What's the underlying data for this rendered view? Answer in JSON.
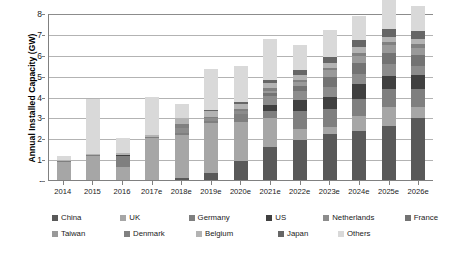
{
  "chart_data": {
    "type": "bar",
    "stacked": true,
    "title": "",
    "xlabel": "",
    "ylabel": "Annual Installed Capacity (GW)",
    "ylim": [
      0,
      8
    ],
    "yticks": [
      "-",
      "1",
      "2",
      "3",
      "4",
      "5",
      "6",
      "7",
      "8"
    ],
    "grid": true,
    "legend_position": "bottom",
    "categories": [
      "2014",
      "2015",
      "2016",
      "2017e",
      "2018e",
      "2019e",
      "2020e",
      "2021e",
      "2022e",
      "2023e",
      "2024e",
      "2025e",
      "2026e"
    ],
    "series": [
      {
        "name": "China",
        "color": "#595959",
        "values": [
          0.0,
          0.0,
          0.0,
          0.0,
          0.1,
          0.35,
          0.9,
          1.6,
          1.9,
          2.2,
          2.35,
          2.6,
          2.95
        ]
      },
      {
        "name": "UK",
        "color": "#a6a6a6",
        "values": [
          0.85,
          1.15,
          0.6,
          2.0,
          2.05,
          2.4,
          1.9,
          1.35,
          0.55,
          0.35,
          0.7,
          0.9,
          0.55
        ]
      },
      {
        "name": "Germany",
        "color": "#7f7f7f",
        "values": [
          0.05,
          0.05,
          0.55,
          0.05,
          0.1,
          0.1,
          0.35,
          0.35,
          0.85,
          0.85,
          0.85,
          0.85,
          0.85
        ]
      },
      {
        "name": "US",
        "color": "#404040",
        "values": [
          0.0,
          0.0,
          0.03,
          0.0,
          0.0,
          0.0,
          0.0,
          0.3,
          0.55,
          0.6,
          0.7,
          0.65,
          0.7
        ]
      },
      {
        "name": "Netherlands",
        "color": "#8c8c8c",
        "values": [
          0.0,
          0.0,
          0.0,
          0.0,
          0.25,
          0.1,
          0.15,
          0.45,
          0.4,
          0.45,
          0.5,
          0.55,
          0.4
        ]
      },
      {
        "name": "France",
        "color": "#737373",
        "values": [
          0.0,
          0.0,
          0.0,
          0.0,
          0.0,
          0.0,
          0.0,
          0.1,
          0.25,
          0.5,
          0.5,
          0.55,
          0.55
        ]
      },
      {
        "name": "Taiwan",
        "color": "#999999",
        "values": [
          0.0,
          0.0,
          0.0,
          0.0,
          0.0,
          0.0,
          0.0,
          0.1,
          0.2,
          0.3,
          0.35,
          0.35,
          0.35
        ]
      },
      {
        "name": "Denmark",
        "color": "#808080",
        "values": [
          0.0,
          0.0,
          0.0,
          0.0,
          0.2,
          0.05,
          0.1,
          0.15,
          0.1,
          0.1,
          0.15,
          0.15,
          0.15
        ]
      },
      {
        "name": "Belgium",
        "color": "#b3b3b3",
        "values": [
          0.05,
          0.05,
          0.1,
          0.1,
          0.25,
          0.3,
          0.25,
          0.25,
          0.25,
          0.25,
          0.25,
          0.25,
          0.25
        ]
      },
      {
        "name": "Japan",
        "color": "#666666",
        "values": [
          0.0,
          0.0,
          0.0,
          0.0,
          0.0,
          0.05,
          0.1,
          0.15,
          0.2,
          0.3,
          0.35,
          0.4,
          0.4
        ]
      },
      {
        "name": "Others",
        "color": "#d9d9d9",
        "values": [
          0.2,
          2.65,
          0.72,
          1.85,
          0.7,
          1.95,
          1.7,
          1.95,
          1.2,
          1.3,
          1.15,
          1.45,
          1.2
        ]
      }
    ],
    "totals": [
      1.15,
      3.9,
      2.0,
      4.0,
      3.65,
      5.3,
      5.45,
      6.75,
      6.45,
      7.2,
      7.85,
      8.7,
      8.35
    ]
  },
  "axis": {
    "y_title": "Annual Installed Capacity (GW)"
  },
  "legend": {
    "rows": [
      [
        {
          "label": "China",
          "color": "#595959"
        },
        {
          "label": "UK",
          "color": "#a6a6a6"
        },
        {
          "label": "Germany",
          "color": "#7f7f7f"
        },
        {
          "label": "US",
          "color": "#404040"
        },
        {
          "label": "Netherlands",
          "color": "#8c8c8c"
        },
        {
          "label": "France",
          "color": "#737373"
        }
      ],
      [
        {
          "label": "Taiwan",
          "color": "#999999"
        },
        {
          "label": "Denmark",
          "color": "#808080"
        },
        {
          "label": "Belgium",
          "color": "#b3b3b3"
        },
        {
          "label": "Japan",
          "color": "#666666"
        },
        {
          "label": "Others",
          "color": "#d9d9d9"
        }
      ]
    ]
  },
  "colors": {
    "plot_border": "#808080",
    "gridline": "#b3b3b3",
    "background": "#ffffff",
    "text": "#1a1a1a"
  }
}
